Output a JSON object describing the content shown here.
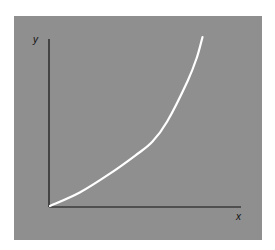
{
  "chart_data": {
    "type": "line",
    "title": "",
    "xlabel": "x",
    "ylabel": "y",
    "grid": false,
    "legend": null,
    "x": [
      0,
      0.16,
      0.32,
      0.46,
      0.55,
      0.63,
      0.74,
      0.79,
      0.82
    ],
    "series": [
      {
        "name": "curve",
        "values": [
          0,
          0.08,
          0.19,
          0.3,
          0.38,
          0.5,
          0.74,
          0.88,
          1.0
        ]
      }
    ],
    "xlim": [
      0,
      1
    ],
    "ylim": [
      0,
      1
    ],
    "colors": {
      "background": "#8f8f8f",
      "curve": "#ffffff",
      "axes": "#111111"
    }
  },
  "labels": {
    "x": "x",
    "y": "y"
  }
}
